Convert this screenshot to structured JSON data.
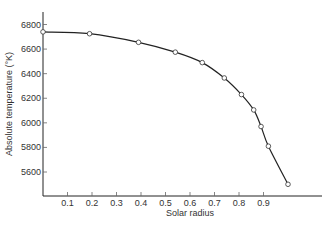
{
  "chart_data": {
    "type": "line",
    "title": "",
    "xlabel": "Solar radius",
    "ylabel": "Absolute temperature (°K)",
    "xlim": [
      0,
      1.0
    ],
    "ylim": [
      5500,
      6800
    ],
    "grid": false,
    "legend": "none",
    "x_ticks": [
      0.1,
      0.2,
      0.3,
      0.4,
      0.5,
      0.6,
      0.7,
      0.8,
      0.9
    ],
    "x_tick_labels": [
      "0.1",
      "0.2",
      "0.3",
      "0.4",
      "0.5",
      "0.6",
      "0.7",
      "0.8",
      "0.9"
    ],
    "y_ticks": [
      5600,
      5800,
      6000,
      6200,
      6400,
      6600,
      6800
    ],
    "y_tick_labels": [
      "5600",
      "5800",
      "6000",
      "6200",
      "6400",
      "6600",
      "6800"
    ],
    "series": [
      {
        "name": "Temperature",
        "markers": "open-circle",
        "x": [
          0.0,
          0.19,
          0.39,
          0.54,
          0.65,
          0.74,
          0.81,
          0.86,
          0.89,
          0.92,
          1.0
        ],
        "y": [
          6740,
          6725,
          6655,
          6575,
          6490,
          6365,
          6230,
          6105,
          5970,
          5810,
          5500
        ]
      }
    ]
  }
}
